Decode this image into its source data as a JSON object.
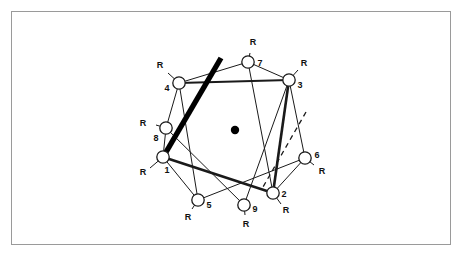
{
  "figure": {
    "title": "",
    "type": "molecular-ring-conformation-diagram",
    "background_color": "#ffffff",
    "frame": {
      "stroke": "#9a9a9a",
      "x": 11,
      "y": 11,
      "width": 440,
      "height": 234
    }
  },
  "diagram": {
    "center_dot": {
      "label": "center-point",
      "x": 235,
      "y": 130,
      "r": 4.2,
      "color": "#000000"
    },
    "nodes": [
      {
        "id": "1",
        "number_label": "1",
        "substituent_label": "R",
        "cx": 163,
        "cy": 157,
        "r": 6.2,
        "num_x": 167,
        "num_y": 170,
        "r_x": 143,
        "r_y": 172,
        "bond_x2": 150,
        "bond_y2": 168
      },
      {
        "id": "2",
        "number_label": "2",
        "substituent_label": "R",
        "cx": 273,
        "cy": 193,
        "r": 6.2,
        "num_x": 284,
        "num_y": 194,
        "r_x": 286,
        "r_y": 210,
        "bond_x2": 281,
        "bond_y2": 204
      },
      {
        "id": "3",
        "number_label": "3",
        "substituent_label": "R",
        "cx": 289,
        "cy": 80,
        "r": 6.2,
        "num_x": 300,
        "num_y": 85,
        "r_x": 304,
        "r_y": 63,
        "bond_x2": 298,
        "bond_y2": 70
      },
      {
        "id": "4",
        "number_label": "4",
        "substituent_label": "R",
        "cx": 179,
        "cy": 83,
        "r": 6.2,
        "num_x": 167,
        "num_y": 88,
        "r_x": 160,
        "r_y": 65,
        "bond_x2": 168,
        "bond_y2": 73
      },
      {
        "id": "5",
        "number_label": "5",
        "substituent_label": "R",
        "cx": 198,
        "cy": 200,
        "r": 6.2,
        "num_x": 209,
        "num_y": 205,
        "r_x": 188,
        "r_y": 217,
        "bond_x2": 192,
        "bond_y2": 209
      },
      {
        "id": "6",
        "number_label": "6",
        "substituent_label": "R",
        "cx": 305,
        "cy": 158,
        "r": 6.2,
        "num_x": 317,
        "num_y": 155,
        "r_x": 322,
        "r_y": 171,
        "bond_x2": 314,
        "bond_y2": 165
      },
      {
        "id": "7",
        "number_label": "7",
        "substituent_label": "R",
        "cx": 248,
        "cy": 62,
        "r": 6.2,
        "num_x": 260,
        "num_y": 63,
        "r_x": 253,
        "r_y": 42,
        "bond_x2": 250,
        "bond_y2": 53
      },
      {
        "id": "8",
        "number_label": "8",
        "substituent_label": "R",
        "cx": 166,
        "cy": 128,
        "r": 6.2,
        "num_x": 156,
        "num_y": 138,
        "r_x": 143,
        "r_y": 123,
        "bond_x2": 156,
        "bond_y2": 125
      },
      {
        "id": "9",
        "number_label": "9",
        "substituent_label": "R",
        "cx": 244,
        "cy": 205,
        "r": 6.2,
        "num_x": 255,
        "num_y": 209,
        "r_x": 246,
        "r_y": 224,
        "bond_x2": 245,
        "bond_y2": 215
      }
    ],
    "bonds_thin": [
      {
        "from": "4",
        "to": "8",
        "x1": 179,
        "y1": 83,
        "x2": 166,
        "y2": 128
      },
      {
        "from": "8",
        "to": "1",
        "x1": 166,
        "y1": 128,
        "x2": 163,
        "y2": 157
      },
      {
        "from": "4",
        "to": "5",
        "x1": 179,
        "y1": 83,
        "x2": 198,
        "y2": 200
      },
      {
        "from": "8",
        "to": "9",
        "x1": 166,
        "y1": 128,
        "x2": 244,
        "y2": 205
      },
      {
        "from": "7",
        "to": "4",
        "x1": 248,
        "y1": 62,
        "x2": 179,
        "y2": 83
      },
      {
        "from": "7",
        "to": "2",
        "x1": 248,
        "y1": 62,
        "x2": 273,
        "y2": 193
      },
      {
        "from": "3",
        "to": "6",
        "x1": 289,
        "y1": 80,
        "x2": 305,
        "y2": 158
      },
      {
        "from": "6",
        "to": "2",
        "x1": 305,
        "y1": 158,
        "x2": 273,
        "y2": 193
      },
      {
        "from": "5",
        "to": "6",
        "x1": 198,
        "y1": 200,
        "x2": 305,
        "y2": 158
      },
      {
        "from": "9",
        "to": "3",
        "x1": 244,
        "y1": 205,
        "x2": 289,
        "y2": 80
      },
      {
        "from": "1",
        "to": "5",
        "x1": 163,
        "y1": 157,
        "x2": 198,
        "y2": 200
      },
      {
        "from": "7",
        "to": "3",
        "x1": 248,
        "y1": 62,
        "x2": 289,
        "y2": 80
      }
    ],
    "bonds_medium": [
      {
        "from": "4",
        "to": "3",
        "x1": 179,
        "y1": 83,
        "x2": 289,
        "y2": 80
      }
    ],
    "bonds_bold": [
      {
        "from": "3",
        "to": "2",
        "x1": 289,
        "y1": 80,
        "x2": 273,
        "y2": 193
      },
      {
        "from": "1",
        "to": "2",
        "x1": 163,
        "y1": 157,
        "x2": 273,
        "y2": 193
      }
    ],
    "bold_stroke": {
      "label": "bold-plane-line",
      "x1": 221,
      "y1": 58,
      "x2": 162,
      "y2": 159,
      "width": 5.4,
      "color": "#000000"
    },
    "dashed_stroke": {
      "label": "dashed-plane-line",
      "x1": 306,
      "y1": 112,
      "x2": 263,
      "y2": 187,
      "width": 1.3,
      "dash": "5 4",
      "color": "#1a1a1a"
    },
    "colors": {
      "line": "#1a1a1a",
      "node_fill": "#ffffff",
      "node_stroke": "#1a1a1a",
      "text": "#111111",
      "frame": "#9a9a9a"
    }
  }
}
